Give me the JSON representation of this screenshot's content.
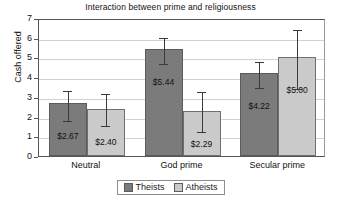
{
  "chart_data": {
    "type": "bar",
    "title": "Interaction between prime and religiousness",
    "xlabel": "",
    "ylabel": "Cash offered",
    "ylim": [
      0,
      7
    ],
    "yticks": [
      0,
      1,
      2,
      3,
      4,
      5,
      6,
      7
    ],
    "grid": true,
    "legend_position": "bottom",
    "categories": [
      "Neutral",
      "God prime",
      "Secular prime"
    ],
    "series": [
      {
        "name": "Theists",
        "color": "#7b7b7b",
        "values": [
          2.67,
          5.44,
          4.22
        ],
        "labels": [
          "$2.67",
          "$5.44",
          "$4.22"
        ],
        "error_low": [
          1.9,
          4.75,
          3.57
        ],
        "error_high": [
          3.4,
          6.1,
          4.88
        ]
      },
      {
        "name": "Atheists",
        "color": "#cacaca",
        "values": [
          2.4,
          2.29,
          5.0
        ],
        "labels": [
          "$2.40",
          "$2.29",
          "$5.00"
        ],
        "error_low": [
          1.6,
          1.3,
          3.48
        ],
        "error_high": [
          3.25,
          3.35,
          6.5
        ]
      }
    ]
  },
  "legend": {
    "items": [
      {
        "label": "Theists"
      },
      {
        "label": "Atheists"
      }
    ]
  }
}
